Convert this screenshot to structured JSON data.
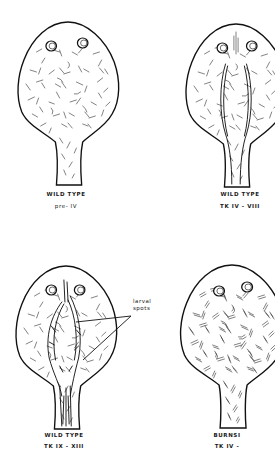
{
  "figure": {
    "panels": [
      {
        "id": "wild-type-pre-iv",
        "title": "WILD TYPE",
        "stage": "pre- IV",
        "pattern": "uniform scattered melanophores"
      },
      {
        "id": "wild-type-tk-iv-viii",
        "title": "WILD TYPE",
        "stage": "TK IV - VIII",
        "pattern": "paired dorsal stripes forming"
      },
      {
        "id": "wild-type-tk-ix-xiii",
        "title": "WILD TYPE",
        "stage": "TK IX - XIII",
        "pattern": "larval spots along midline"
      },
      {
        "id": "burnsi-tk-iv",
        "title": "BURNSI",
        "stage": "TK IV -",
        "pattern": "uniform scattered melanophores, no spots"
      }
    ],
    "annotation": {
      "line1": "larval",
      "line2": "spots"
    }
  },
  "colors": {
    "ink": "#111111",
    "paper": "#ffffff"
  }
}
